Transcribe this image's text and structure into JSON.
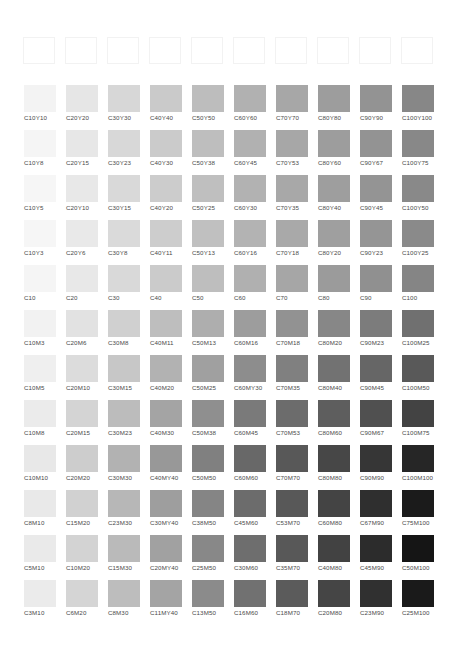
{
  "outline_row": {
    "count": 10
  },
  "grid": {
    "col_x": [
      24,
      66,
      108,
      150,
      192,
      234,
      276,
      318,
      360,
      402
    ],
    "row_y": [
      85,
      130,
      175,
      220,
      265,
      310,
      355,
      400,
      445,
      490,
      535,
      580
    ],
    "rows": [
      {
        "cells": [
          {
            "label": "C10Y10",
            "color": "#f3f3f3"
          },
          {
            "label": "C20Y20",
            "color": "#e6e6e6"
          },
          {
            "label": "C30Y30",
            "color": "#d7d7d7"
          },
          {
            "label": "C40Y40",
            "color": "#cacaca"
          },
          {
            "label": "C50Y50",
            "color": "#bdbdbd"
          },
          {
            "label": "C60Y60",
            "color": "#b1b1b1"
          },
          {
            "label": "C70Y70",
            "color": "#a7a7a7"
          },
          {
            "label": "C80Y80",
            "color": "#9d9d9d"
          },
          {
            "label": "C90Y90",
            "color": "#939393"
          },
          {
            "label": "C100Y100",
            "color": "#878787"
          }
        ]
      },
      {
        "cells": [
          {
            "label": "C10Y8",
            "color": "#f5f5f5"
          },
          {
            "label": "C20Y15",
            "color": "#e7e7e7"
          },
          {
            "label": "C30Y23",
            "color": "#d8d8d8"
          },
          {
            "label": "C40Y30",
            "color": "#cbcbcb"
          },
          {
            "label": "C50Y38",
            "color": "#bebebe"
          },
          {
            "label": "C60Y45",
            "color": "#b1b1b1"
          },
          {
            "label": "C70Y53",
            "color": "#a7a7a7"
          },
          {
            "label": "C80Y60",
            "color": "#9d9d9d"
          },
          {
            "label": "C90Y67",
            "color": "#939393"
          },
          {
            "label": "C100Y75",
            "color": "#888888"
          }
        ]
      },
      {
        "cells": [
          {
            "label": "C10Y5",
            "color": "#f6f6f6"
          },
          {
            "label": "C20Y10",
            "color": "#e8e8e8"
          },
          {
            "label": "C30Y15",
            "color": "#d9d9d9"
          },
          {
            "label": "C40Y20",
            "color": "#cccccc"
          },
          {
            "label": "C50Y25",
            "color": "#bfbfbf"
          },
          {
            "label": "C60Y30",
            "color": "#b2b2b2"
          },
          {
            "label": "C70Y35",
            "color": "#a8a8a8"
          },
          {
            "label": "C80Y40",
            "color": "#9e9e9e"
          },
          {
            "label": "C90Y45",
            "color": "#949494"
          },
          {
            "label": "C100Y50",
            "color": "#898989"
          }
        ]
      },
      {
        "cells": [
          {
            "label": "C10Y3",
            "color": "#f6f6f6"
          },
          {
            "label": "C20Y6",
            "color": "#e9e9e9"
          },
          {
            "label": "C30Y8",
            "color": "#dadada"
          },
          {
            "label": "C40Y11",
            "color": "#cdcdcd"
          },
          {
            "label": "C50Y13",
            "color": "#c0c0c0"
          },
          {
            "label": "C60Y16",
            "color": "#b3b3b3"
          },
          {
            "label": "C70Y18",
            "color": "#a9a9a9"
          },
          {
            "label": "C80Y20",
            "color": "#9f9f9f"
          },
          {
            "label": "C90Y23",
            "color": "#959595"
          },
          {
            "label": "C100Y25",
            "color": "#8a8a8a"
          }
        ]
      },
      {
        "cells": [
          {
            "label": "C10",
            "color": "#f5f5f5"
          },
          {
            "label": "C20",
            "color": "#e8e8e8"
          },
          {
            "label": "C30",
            "color": "#d9d9d9"
          },
          {
            "label": "C40",
            "color": "#cbcbcb"
          },
          {
            "label": "C50",
            "color": "#bebebe"
          },
          {
            "label": "C60",
            "color": "#b0b0b0"
          },
          {
            "label": "C70",
            "color": "#a6a6a6"
          },
          {
            "label": "C80",
            "color": "#9b9b9b"
          },
          {
            "label": "C90",
            "color": "#909090"
          },
          {
            "label": "C100",
            "color": "#858585"
          }
        ]
      },
      {
        "cells": [
          {
            "label": "C10M3",
            "color": "#f2f2f2"
          },
          {
            "label": "C20M6",
            "color": "#e2e2e2"
          },
          {
            "label": "C30M8",
            "color": "#d0d0d0"
          },
          {
            "label": "C40M11",
            "color": "#bebebe"
          },
          {
            "label": "C50M13",
            "color": "#aeaeae"
          },
          {
            "label": "C60M16",
            "color": "#9d9d9d"
          },
          {
            "label": "C70M18",
            "color": "#929292"
          },
          {
            "label": "C80M20",
            "color": "#878787"
          },
          {
            "label": "C90M23",
            "color": "#7c7c7c"
          },
          {
            "label": "C100M25",
            "color": "#707070"
          }
        ]
      },
      {
        "cells": [
          {
            "label": "C10M5",
            "color": "#efefef"
          },
          {
            "label": "C20M10",
            "color": "#dcdcdc"
          },
          {
            "label": "C30M15",
            "color": "#c7c7c7"
          },
          {
            "label": "C40M20",
            "color": "#b2b2b2"
          },
          {
            "label": "C50M25",
            "color": "#a0a0a0"
          },
          {
            "label": "C60MY30",
            "color": "#8d8d8d"
          },
          {
            "label": "C70M35",
            "color": "#808080"
          },
          {
            "label": "C80M40",
            "color": "#727272"
          },
          {
            "label": "C90M45",
            "color": "#666666"
          },
          {
            "label": "C100M50",
            "color": "#595959"
          }
        ]
      },
      {
        "cells": [
          {
            "label": "C10M8",
            "color": "#ebebeb"
          },
          {
            "label": "C20M15",
            "color": "#d4d4d4"
          },
          {
            "label": "C30M23",
            "color": "#bcbcbc"
          },
          {
            "label": "C40M30",
            "color": "#a4a4a4"
          },
          {
            "label": "C50M38",
            "color": "#8f8f8f"
          },
          {
            "label": "C60M45",
            "color": "#7a7a7a"
          },
          {
            "label": "C70M53",
            "color": "#6c6c6c"
          },
          {
            "label": "C80M60",
            "color": "#5e5e5e"
          },
          {
            "label": "C90M67",
            "color": "#505050"
          },
          {
            "label": "C100M75",
            "color": "#434343"
          }
        ]
      },
      {
        "cells": [
          {
            "label": "C10M10",
            "color": "#e8e8e8"
          },
          {
            "label": "C20M20",
            "color": "#cdcdcd"
          },
          {
            "label": "C30M30",
            "color": "#b2b2b2"
          },
          {
            "label": "C40MY40",
            "color": "#989898"
          },
          {
            "label": "C50M50",
            "color": "#808080"
          },
          {
            "label": "C60M60",
            "color": "#686868"
          },
          {
            "label": "C70M70",
            "color": "#585858"
          },
          {
            "label": "C80M80",
            "color": "#474747"
          },
          {
            "label": "C90M90",
            "color": "#363636"
          },
          {
            "label": "C100M100",
            "color": "#262626"
          }
        ]
      },
      {
        "cells": [
          {
            "label": "C8M10",
            "color": "#e9e9e9"
          },
          {
            "label": "C15M20",
            "color": "#d1d1d1"
          },
          {
            "label": "C23M30",
            "color": "#b7b7b7"
          },
          {
            "label": "C30MY40",
            "color": "#9e9e9e"
          },
          {
            "label": "C38M50",
            "color": "#858585"
          },
          {
            "label": "C45M60",
            "color": "#6c6c6c"
          },
          {
            "label": "C53M70",
            "color": "#585858"
          },
          {
            "label": "C60M80",
            "color": "#444444"
          },
          {
            "label": "C67M90",
            "color": "#2f2f2f"
          },
          {
            "label": "C75M100",
            "color": "#1b1b1b"
          }
        ]
      },
      {
        "cells": [
          {
            "label": "C5M10",
            "color": "#eaeaea"
          },
          {
            "label": "C10M20",
            "color": "#d3d3d3"
          },
          {
            "label": "C15M30",
            "color": "#bababa"
          },
          {
            "label": "C20MY40",
            "color": "#a1a1a1"
          },
          {
            "label": "C25M50",
            "color": "#888888"
          },
          {
            "label": "C30M60",
            "color": "#6e6e6e"
          },
          {
            "label": "C35M70",
            "color": "#585858"
          },
          {
            "label": "C40M80",
            "color": "#424242"
          },
          {
            "label": "C45M90",
            "color": "#2c2c2c"
          },
          {
            "label": "C50M100",
            "color": "#151515"
          }
        ]
      },
      {
        "cells": [
          {
            "label": "C3M10",
            "color": "#ebebeb"
          },
          {
            "label": "C6M20",
            "color": "#d5d5d5"
          },
          {
            "label": "C8M30",
            "color": "#bdbdbd"
          },
          {
            "label": "C11MY40",
            "color": "#a4a4a4"
          },
          {
            "label": "C13M50",
            "color": "#8b8b8b"
          },
          {
            "label": "C16M60",
            "color": "#717171"
          },
          {
            "label": "C18M70",
            "color": "#5b5b5b"
          },
          {
            "label": "C20M80",
            "color": "#454545"
          },
          {
            "label": "C23M90",
            "color": "#303030"
          },
          {
            "label": "C25M100",
            "color": "#1a1a1a"
          }
        ]
      }
    ]
  }
}
